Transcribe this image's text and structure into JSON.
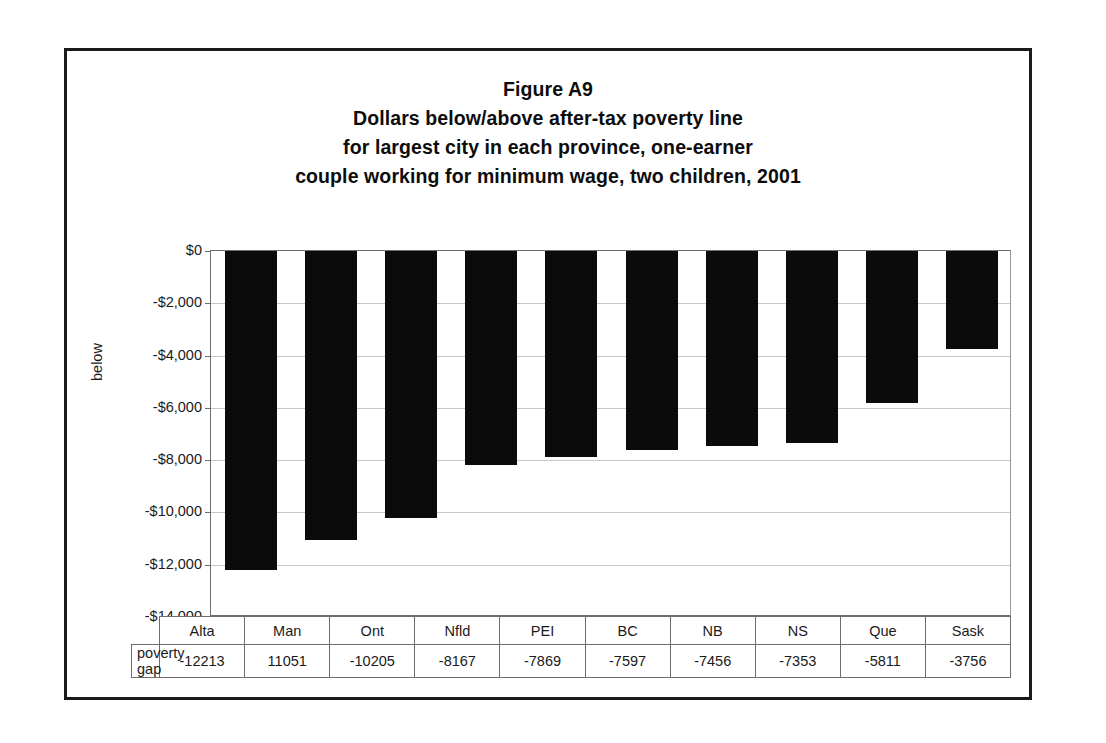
{
  "figure": {
    "title_lines": [
      "Figure A9",
      "Dollars below/above after-tax poverty line",
      "for largest city in each province, one-earner",
      "couple working for minimum wage, two children, 2001"
    ],
    "y_axis_title": "below",
    "table_row_label": "poverty gap"
  },
  "chart_data": {
    "type": "bar",
    "xlabel": "",
    "ylabel": "below",
    "ylim": [
      -14000,
      0
    ],
    "grid": true,
    "legend": "none",
    "orientation": "vertical",
    "categories": [
      "Alta",
      "Man",
      "Ont",
      "Nfld",
      "PEI",
      "BC",
      "NB",
      "NS",
      "Que",
      "Sask"
    ],
    "values": [
      -12213,
      -11051,
      -10205,
      -8167,
      -7869,
      -7597,
      -7456,
      -7353,
      -5811,
      -3756
    ],
    "value_labels": [
      "-12213",
      "11051",
      "-10205",
      "-8167",
      "-7869",
      "-7597",
      "-7456",
      "-7353",
      "-5811",
      "-3756"
    ],
    "ytick_values": [
      0,
      -2000,
      -4000,
      -6000,
      -8000,
      -10000,
      -12000,
      -14000
    ],
    "ytick_labels": [
      "$0",
      "-$2,000",
      "-$4,000",
      "-$6,000",
      "-$8,000",
      "-$10,000",
      "-$12,000",
      "-$14,000"
    ],
    "series_name": "poverty gap",
    "bar_color": "#0b0b0b"
  }
}
